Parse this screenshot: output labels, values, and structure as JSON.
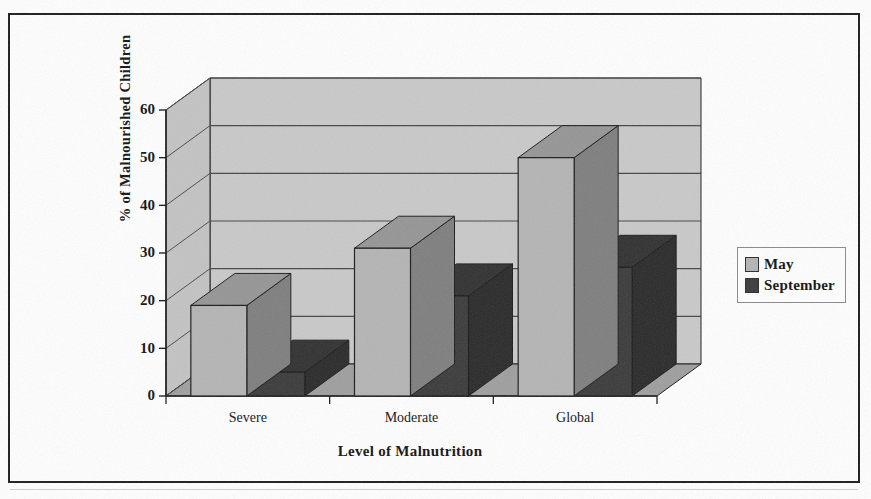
{
  "chart_data": {
    "type": "bar",
    "title": "",
    "subtitle": "",
    "xlabel": "Level of Malnutrition",
    "ylabel": "% of Malnourished Children",
    "categories": [
      "Severe",
      "Moderate",
      "Global"
    ],
    "series": [
      {
        "name": "May",
        "values": [
          19,
          31,
          50
        ],
        "color": "#b4b4b4"
      },
      {
        "name": "September",
        "values": [
          5,
          21,
          27
        ],
        "color": "#3a3a3a"
      }
    ],
    "ylim": [
      0,
      60
    ],
    "yticks": [
      0,
      10,
      20,
      30,
      40,
      50,
      60
    ],
    "ytick_labels": [
      "0",
      "10",
      "20",
      "30",
      "40",
      "50",
      "60"
    ],
    "grid": true,
    "grid_axis": "y",
    "legend_position": "right",
    "style": "3d-clustered-bars",
    "plot_background": "#c9c9c9",
    "floor_color": "#9e9e9e",
    "axis_color": "#1a1a1a",
    "page_background": "#ffffff"
  },
  "legend": {
    "items": [
      {
        "label": "May",
        "swatch": "#b4b4b4"
      },
      {
        "label": "September",
        "swatch": "#3a3a3a"
      }
    ]
  },
  "axes": {
    "y_title": "% of Malnourished Children",
    "x_title": "Level of Malnutrition"
  }
}
